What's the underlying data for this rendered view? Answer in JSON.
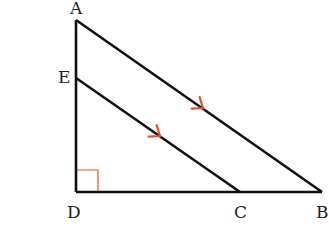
{
  "diagram": {
    "type": "geometry-triangle",
    "points": {
      "A": {
        "label": "A",
        "x": 76,
        "y": 20
      },
      "E": {
        "label": "E",
        "x": 76,
        "y": 78
      },
      "D": {
        "label": "D",
        "x": 76,
        "y": 192
      },
      "C": {
        "label": "C",
        "x": 240,
        "y": 192
      },
      "B": {
        "label": "B",
        "x": 322,
        "y": 192
      }
    },
    "segments": [
      {
        "from": "A",
        "to": "D"
      },
      {
        "from": "D",
        "to": "B"
      },
      {
        "from": "A",
        "to": "B",
        "parallel_mark": true
      },
      {
        "from": "E",
        "to": "C",
        "parallel_mark": true
      }
    ],
    "right_angle_at": "D",
    "colors": {
      "line": "#111111",
      "mark": "#e8502a",
      "label": "#222222"
    }
  }
}
